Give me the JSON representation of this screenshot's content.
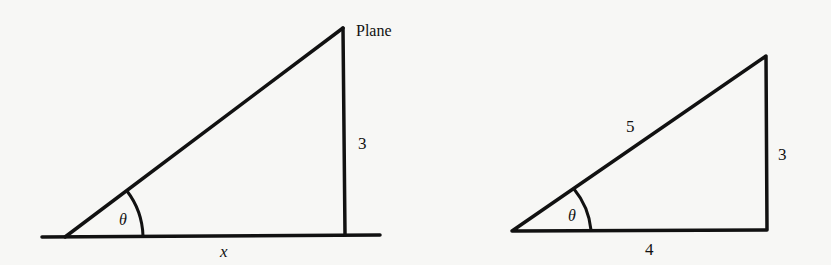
{
  "figure": {
    "left_triangle": {
      "name": "plane-elevation-triangle",
      "labels": {
        "top_vertex": "Plane",
        "vertical_side": "3",
        "angle": "θ",
        "base": "x"
      },
      "vertices": {
        "angle_vertex": [
          65,
          237
        ],
        "top": [
          343,
          28
        ],
        "right_angle": [
          345,
          235
        ]
      },
      "ground_line": {
        "x1": 42,
        "x2": 380,
        "y": 236
      }
    },
    "right_triangle": {
      "name": "3-4-5-triangle",
      "labels": {
        "hypotenuse": "5",
        "vertical_side": "3",
        "angle": "θ",
        "base": "4"
      },
      "vertices": {
        "angle_vertex": [
          512,
          231
        ],
        "top": [
          766,
          56
        ],
        "right_angle": [
          767,
          230
        ]
      }
    },
    "stroke_color": "#111111",
    "background_color": "#f7f7f5"
  }
}
